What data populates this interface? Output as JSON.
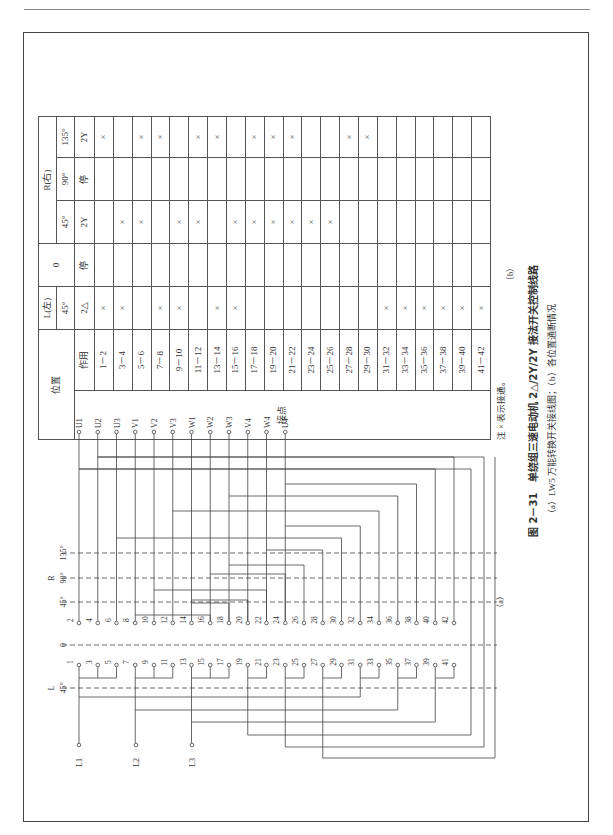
{
  "figure": {
    "number": "图 2－31",
    "title": "单绕组三速电动机 2△/2Y/2Y 接法开关控制线路",
    "subcaption": "（a）LW5 万能转换开关接线图；（b）各位置通断情况",
    "label_a": "（a）",
    "label_b": "（b）"
  },
  "table": {
    "header_position": "位置",
    "header_function": "作用",
    "header_contacts": "接点",
    "groups": [
      {
        "name": "L(左)",
        "angle": "45°",
        "function": "2△"
      },
      {
        "name": "0",
        "angle": "",
        "function": "停"
      },
      {
        "name": "R(右)",
        "angle": "45°",
        "function": "2Y"
      },
      {
        "name": "",
        "angle": "90°",
        "function": "停"
      },
      {
        "name": "",
        "angle": "135°",
        "function": "2Y"
      }
    ],
    "rows": [
      {
        "contact": "1－2",
        "marks": [
          "×",
          "",
          "",
          "",
          "×"
        ]
      },
      {
        "contact": "3－4",
        "marks": [
          "×",
          "",
          "×",
          "",
          ""
        ]
      },
      {
        "contact": "5－6",
        "marks": [
          "",
          "",
          "×",
          "",
          "×"
        ]
      },
      {
        "contact": "7－8",
        "marks": [
          "×",
          "",
          "",
          "",
          "×"
        ]
      },
      {
        "contact": "9－10",
        "marks": [
          "×",
          "",
          "×",
          "",
          ""
        ]
      },
      {
        "contact": "11－12",
        "marks": [
          "",
          "",
          "×",
          "",
          "×"
        ]
      },
      {
        "contact": "13－14",
        "marks": [
          "×",
          "",
          "",
          "",
          "×"
        ]
      },
      {
        "contact": "15－16",
        "marks": [
          "×",
          "",
          "×",
          "",
          ""
        ]
      },
      {
        "contact": "17－18",
        "marks": [
          "",
          "",
          "×",
          "",
          "×"
        ]
      },
      {
        "contact": "19－20",
        "marks": [
          "",
          "",
          "×",
          "",
          "×"
        ]
      },
      {
        "contact": "21－22",
        "marks": [
          "",
          "",
          "×",
          "",
          "×"
        ]
      },
      {
        "contact": "23－24",
        "marks": [
          "",
          "",
          "×",
          "",
          ""
        ]
      },
      {
        "contact": "25－26",
        "marks": [
          "",
          "",
          "×",
          "",
          ""
        ]
      },
      {
        "contact": "27－28",
        "marks": [
          "",
          "",
          "",
          "",
          "×"
        ]
      },
      {
        "contact": "29－30",
        "marks": [
          "",
          "",
          "",
          "",
          "×"
        ]
      },
      {
        "contact": "31－32",
        "marks": [
          "×",
          "",
          "",
          "",
          ""
        ]
      },
      {
        "contact": "33－34",
        "marks": [
          "×",
          "",
          "",
          "",
          ""
        ]
      },
      {
        "contact": "35－36",
        "marks": [
          "×",
          "",
          "",
          "",
          ""
        ]
      },
      {
        "contact": "37－38",
        "marks": [
          "×",
          "",
          "",
          "",
          ""
        ]
      },
      {
        "contact": "39－40",
        "marks": [
          "×",
          "",
          "",
          "",
          ""
        ]
      },
      {
        "contact": "41－42",
        "marks": [
          "×",
          "",
          "",
          "",
          ""
        ]
      }
    ],
    "note": "注  × 表示接通。"
  },
  "diagram": {
    "outputs": [
      "U1",
      "U2",
      "U3",
      "V1",
      "V2",
      "V3",
      "W1",
      "W2",
      "W3",
      "V4",
      "W4",
      "U4"
    ],
    "inputs": [
      "L1",
      "L2",
      "L3"
    ],
    "left_label": "L",
    "right_label": "R",
    "positions": {
      "L45": "45°",
      "zero": "0",
      "R45": "45°",
      "R90": "90°",
      "R135": "135°"
    },
    "even_terminals": [
      "2",
      "4",
      "6",
      "8",
      "10",
      "12",
      "14",
      "16",
      "18",
      "20",
      "22",
      "24",
      "26",
      "28",
      "30",
      "32",
      "34",
      "36",
      "38",
      "40",
      "42"
    ],
    "odd_terminals": [
      "1",
      "3",
      "5",
      "7",
      "9",
      "11",
      "13",
      "15",
      "17",
      "19",
      "21",
      "23",
      "25",
      "27",
      "29",
      "31",
      "33",
      "35",
      "37",
      "39",
      "41"
    ]
  }
}
